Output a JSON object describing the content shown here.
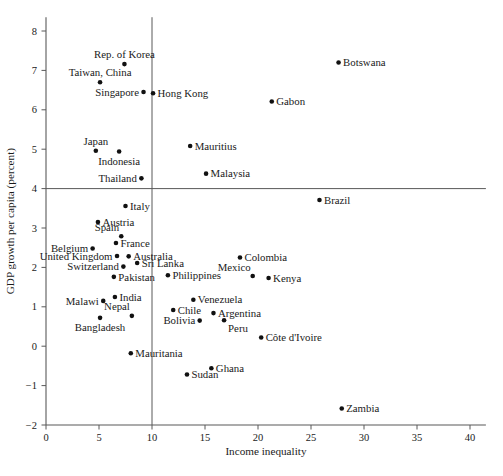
{
  "chart_data": {
    "type": "scatter",
    "title": "",
    "xlabel": "Income inequality",
    "ylabel": "GDP growth per capita (percent)",
    "xlim": [
      0,
      41.5
    ],
    "ylim": [
      -2,
      8.35
    ],
    "xticks": [
      "0",
      "5",
      "10",
      "15",
      "20",
      "25",
      "30",
      "35",
      "40"
    ],
    "xtick_values": [
      0,
      5,
      10,
      15,
      20,
      25,
      30,
      35,
      40
    ],
    "yticks": [
      "8",
      "7",
      "6",
      "5",
      "4",
      "3",
      "2",
      "1",
      "0",
      "−1",
      "−2"
    ],
    "ytick_values": [
      8,
      7,
      6,
      5,
      4,
      3,
      2,
      1,
      0,
      -1,
      -2
    ],
    "grid": false,
    "legend": null,
    "reference_lines": [
      {
        "orientation": "horizontal",
        "value": 4.0
      },
      {
        "orientation": "vertical",
        "value": 10.0
      }
    ],
    "points": [
      {
        "label": "Rep. of Korea",
        "x": 7.4,
        "y": 7.16,
        "label_pos": "above"
      },
      {
        "label": "Taiwan, China",
        "x": 5.1,
        "y": 6.7,
        "label_pos": "above"
      },
      {
        "label": "Singapore",
        "x": 9.2,
        "y": 6.45,
        "label_pos": "left"
      },
      {
        "label": "Hong Kong",
        "x": 10.1,
        "y": 6.42,
        "label_pos": "right"
      },
      {
        "label": "Botswana",
        "x": 27.6,
        "y": 7.2,
        "label_pos": "right"
      },
      {
        "label": "Gabon",
        "x": 21.3,
        "y": 6.21,
        "label_pos": "right"
      },
      {
        "label": "Japan",
        "x": 4.7,
        "y": 4.96,
        "label_pos": "above"
      },
      {
        "label": "Indonesia",
        "x": 6.9,
        "y": 4.94,
        "label_pos": "below"
      },
      {
        "label": "Mauritius",
        "x": 13.6,
        "y": 5.08,
        "label_pos": "right"
      },
      {
        "label": "Thailand",
        "x": 9.0,
        "y": 4.26,
        "label_pos": "left"
      },
      {
        "label": "Malaysia",
        "x": 15.1,
        "y": 4.38,
        "label_pos": "right"
      },
      {
        "label": "Brazil",
        "x": 25.8,
        "y": 3.71,
        "label_pos": "right"
      },
      {
        "label": "Italy",
        "x": 7.5,
        "y": 3.56,
        "label_pos": "right"
      },
      {
        "label": "Austria",
        "x": 4.9,
        "y": 3.15,
        "label_pos": "right"
      },
      {
        "label": "Spain",
        "x": 7.1,
        "y": 2.79,
        "label_pos": "above-left"
      },
      {
        "label": "Belgium",
        "x": 4.4,
        "y": 2.48,
        "label_pos": "left"
      },
      {
        "label": "France",
        "x": 6.6,
        "y": 2.62,
        "label_pos": "right"
      },
      {
        "label": "United Kingdom",
        "x": 6.7,
        "y": 2.29,
        "label_pos": "left"
      },
      {
        "label": "Australia",
        "x": 7.8,
        "y": 2.28,
        "label_pos": "right"
      },
      {
        "label": "Sri Lanka",
        "x": 8.6,
        "y": 2.11,
        "label_pos": "right"
      },
      {
        "label": "Switzerland",
        "x": 7.3,
        "y": 2.02,
        "label_pos": "left"
      },
      {
        "label": "Pakistan",
        "x": 6.4,
        "y": 1.76,
        "label_pos": "right"
      },
      {
        "label": "Philippines",
        "x": 11.5,
        "y": 1.8,
        "label_pos": "right"
      },
      {
        "label": "Colombia",
        "x": 18.3,
        "y": 2.25,
        "label_pos": "right"
      },
      {
        "label": "Mexico",
        "x": 19.5,
        "y": 1.78,
        "label_pos": "above-left"
      },
      {
        "label": "Kenya",
        "x": 21.0,
        "y": 1.73,
        "label_pos": "right"
      },
      {
        "label": "Malawi",
        "x": 5.4,
        "y": 1.15,
        "label_pos": "left"
      },
      {
        "label": "India",
        "x": 6.5,
        "y": 1.25,
        "label_pos": "right"
      },
      {
        "label": "Nepal",
        "x": 8.1,
        "y": 0.77,
        "label_pos": "above-left"
      },
      {
        "label": "Venezuela",
        "x": 13.9,
        "y": 1.18,
        "label_pos": "right"
      },
      {
        "label": "Chile",
        "x": 12.0,
        "y": 0.92,
        "label_pos": "right"
      },
      {
        "label": "Argentina",
        "x": 15.8,
        "y": 0.84,
        "label_pos": "right"
      },
      {
        "label": "Bolivia",
        "x": 14.5,
        "y": 0.65,
        "label_pos": "left"
      },
      {
        "label": "Peru",
        "x": 16.8,
        "y": 0.66,
        "label_pos": "below-right"
      },
      {
        "label": "Bangladesh",
        "x": 5.1,
        "y": 0.72,
        "label_pos": "below"
      },
      {
        "label": "Côte d'Ivoire",
        "x": 20.3,
        "y": 0.22,
        "label_pos": "right"
      },
      {
        "label": "Mauritania",
        "x": 8.0,
        "y": -0.18,
        "label_pos": "right"
      },
      {
        "label": "Sudan",
        "x": 13.3,
        "y": -0.72,
        "label_pos": "right"
      },
      {
        "label": "Ghana",
        "x": 15.6,
        "y": -0.56,
        "label_pos": "right"
      },
      {
        "label": "Zambia",
        "x": 27.9,
        "y": -1.58,
        "label_pos": "right"
      }
    ]
  }
}
